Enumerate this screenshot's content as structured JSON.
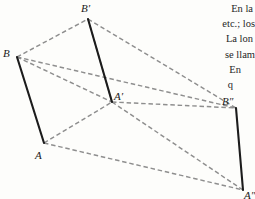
{
  "figure": {
    "caption_alt": "Three parallel congruent segments joined by dashed construction lines",
    "colors": {
      "solid_stroke": "#1c1c1c",
      "dashed_stroke": "#8e8e8e",
      "background": "#fdfdfb",
      "text": "#262626"
    },
    "vertices": [
      {
        "id": "B",
        "label": "B",
        "x": 17,
        "y": 57,
        "label_x": 3,
        "label_y": 48
      },
      {
        "id": "A",
        "label": "A",
        "x": 44,
        "y": 143,
        "label_x": 35,
        "label_y": 150
      },
      {
        "id": "Bp",
        "label": "B′",
        "x": 88,
        "y": 19,
        "label_x": 81,
        "label_y": 3
      },
      {
        "id": "Ap",
        "label": "A′",
        "x": 112,
        "y": 102,
        "label_x": 114,
        "label_y": 91
      },
      {
        "id": "Bpp",
        "label": "B″",
        "x": 236,
        "y": 108,
        "label_x": 222,
        "label_y": 96
      },
      {
        "id": "App",
        "label": "A″",
        "x": 243,
        "y": 190,
        "label_x": 244,
        "label_y": 190
      }
    ],
    "solid_edges": [
      {
        "from": "B",
        "to": "A"
      },
      {
        "from": "Bp",
        "to": "Ap"
      },
      {
        "from": "Bpp",
        "to": "App"
      }
    ],
    "dashed_edges": [
      {
        "from": "B",
        "to": "Bp"
      },
      {
        "from": "B",
        "to": "Ap"
      },
      {
        "from": "B",
        "to": "Bpp"
      },
      {
        "from": "A",
        "to": "Ap"
      },
      {
        "from": "A",
        "to": "App"
      },
      {
        "from": "Ap",
        "to": "Bpp"
      },
      {
        "from": "Ap",
        "to": "App"
      },
      {
        "from": "Bp",
        "to": "Bpp"
      },
      {
        "from": "Bp",
        "to": "Ap"
      }
    ]
  },
  "text_block": {
    "lines": [
      {
        "text": "En la",
        "indent": 0
      },
      {
        "text": "etc.; los",
        "indent": 1
      },
      {
        "text": "La lon",
        "indent": 0
      },
      {
        "text": "se llam",
        "indent": 1
      },
      {
        "text": "En",
        "indent": 2
      },
      {
        "text": "q",
        "indent": 3
      }
    ]
  }
}
